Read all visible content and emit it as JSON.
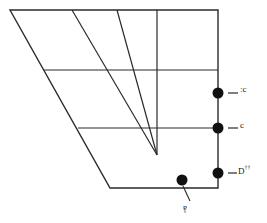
{
  "figure": {
    "background_color": "#ffffff",
    "line_color": "#2b2b2b",
    "marker_color": "#111111",
    "width": 267,
    "height": 223
  },
  "labels": {
    "upper_right": {
      "text": "ɔ:",
      "name": "label-upper-right",
      "orientation": "rotated-180"
    },
    "mid_right": {
      "text": "ɔ",
      "name": "label-mid-right",
      "orientation": "rotated-180"
    },
    "lower_right": {
      "base": "D",
      "superscript": "††",
      "name": "label-lower-right",
      "orientation": "upright"
    },
    "bottom": {
      "text": "å",
      "name": "label-bottom",
      "orientation": "rotated-180"
    }
  },
  "markers": [
    {
      "id": "marker-upper-right",
      "x": 218,
      "y": 93,
      "r": 5.5,
      "label_ref": "upper_right"
    },
    {
      "id": "marker-mid-right",
      "x": 218,
      "y": 128,
      "r": 5.5,
      "label_ref": "mid_right"
    },
    {
      "id": "marker-lower-right",
      "x": 218,
      "y": 173,
      "r": 5.5,
      "label_ref": "lower_right"
    },
    {
      "id": "marker-bottom",
      "x": 182,
      "y": 180,
      "r": 5.5,
      "label_ref": "bottom"
    }
  ],
  "leader_lines": [
    {
      "id": "leader-upper-right",
      "x1": 228,
      "y1": 93,
      "x2": 238,
      "y2": 93
    },
    {
      "id": "leader-mid-right",
      "x1": 228,
      "y1": 128,
      "x2": 238,
      "y2": 128
    },
    {
      "id": "leader-lower-right",
      "x1": 228,
      "y1": 173,
      "x2": 237,
      "y2": 173
    },
    {
      "id": "leader-bottom",
      "x1": 183,
      "y1": 186,
      "x2": 190,
      "y2": 201
    }
  ],
  "geometry": {
    "outline": {
      "name": "trapezoid-outline",
      "points": "10,10 218,10 218,188 110,188"
    },
    "converging_lines": [
      {
        "id": "converging-line-1",
        "x1": 72,
        "y1": 10,
        "x2": 157,
        "y2": 155
      },
      {
        "id": "converging-line-2",
        "x1": 117,
        "y1": 10,
        "x2": 157,
        "y2": 155
      },
      {
        "id": "converging-line-3",
        "x1": 157,
        "y1": 10,
        "x2": 157,
        "y2": 155
      }
    ],
    "strata_lines": [
      {
        "id": "strata-line-upper",
        "x1": 44,
        "y1": 70,
        "x2": 218,
        "y2": 70
      },
      {
        "id": "strata-line-lower",
        "x1": 78,
        "y1": 128,
        "x2": 218,
        "y2": 128
      }
    ]
  }
}
